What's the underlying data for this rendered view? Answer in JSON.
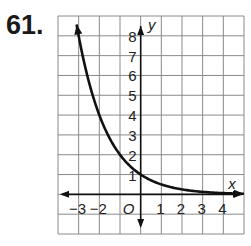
{
  "problem_number": "61.",
  "chart_data": {
    "type": "line",
    "title": "",
    "xlabel": "x",
    "ylabel": "y",
    "origin_label": "O",
    "xlim": [
      -4,
      5
    ],
    "ylim": [
      -2,
      9
    ],
    "grid": true,
    "x_tick_labels": [
      "−3",
      "−2",
      "1",
      "2",
      "3",
      "4"
    ],
    "x_tick_values": [
      -3,
      -2,
      1,
      2,
      3,
      4
    ],
    "y_tick_labels": [
      "1",
      "2",
      "3",
      "4",
      "5",
      "6",
      "7",
      "8"
    ],
    "y_tick_values": [
      1,
      2,
      3,
      4,
      5,
      6,
      7,
      8
    ],
    "series": [
      {
        "name": "y = (1/2)^x",
        "function": "0.5^x",
        "x": [
          -3.1,
          -3,
          -2,
          -1,
          0,
          1,
          2,
          3,
          4,
          5
        ],
        "y": [
          8.57,
          8,
          4,
          2,
          1,
          0.5,
          0.25,
          0.125,
          0.0625,
          0.03125
        ],
        "color": "#111111"
      }
    ]
  }
}
